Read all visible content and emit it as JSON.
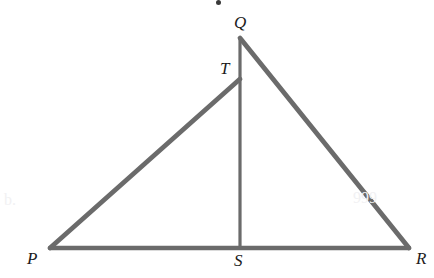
{
  "figure": {
    "type": "geometry-diagram",
    "width": 434,
    "height": 278,
    "background_color": "#ffffff",
    "stroke_color": "#6b6b6b",
    "label_color": "#1c1c1c",
    "points": [
      {
        "name": "P",
        "label": "P",
        "x": 50,
        "y": 248,
        "label_x": 27,
        "label_y": 250
      },
      {
        "name": "Q",
        "label": "Q",
        "x": 240,
        "y": 38,
        "label_x": 234,
        "label_y": 14
      },
      {
        "name": "R",
        "label": "R",
        "x": 409,
        "y": 248,
        "label_x": 416,
        "label_y": 250
      },
      {
        "name": "S",
        "label": "S",
        "x": 240,
        "y": 248,
        "label_x": 234,
        "label_y": 252
      },
      {
        "name": "T",
        "label": "T",
        "x": 240,
        "y": 79,
        "label_x": 220,
        "label_y": 60
      }
    ],
    "segments": [
      {
        "name": "segment-PR",
        "from": "P",
        "to": "R",
        "x1": 50,
        "y1": 248,
        "x2": 409,
        "y2": 248,
        "width": 4.4
      },
      {
        "name": "segment-PT",
        "from": "P",
        "to": "T",
        "x1": 50,
        "y1": 248,
        "x2": 240,
        "y2": 79,
        "width": 4.8
      },
      {
        "name": "segment-QR",
        "from": "Q",
        "to": "R",
        "x1": 240,
        "y1": 38,
        "x2": 409,
        "y2": 248,
        "width": 4.8
      },
      {
        "name": "segment-QS",
        "from": "Q",
        "to": "S",
        "x1": 240,
        "y1": 38,
        "x2": 240,
        "y2": 248,
        "width": 3.2
      }
    ]
  },
  "artifacts": [
    {
      "name": "scan-artifact-left",
      "text": "b.",
      "x": 4,
      "y": 192
    },
    {
      "name": "scan-artifact-right",
      "text": "999",
      "x": 353,
      "y": 190
    },
    {
      "name": "scan-speck-top",
      "x": 216,
      "y": 0,
      "size": 5
    }
  ]
}
